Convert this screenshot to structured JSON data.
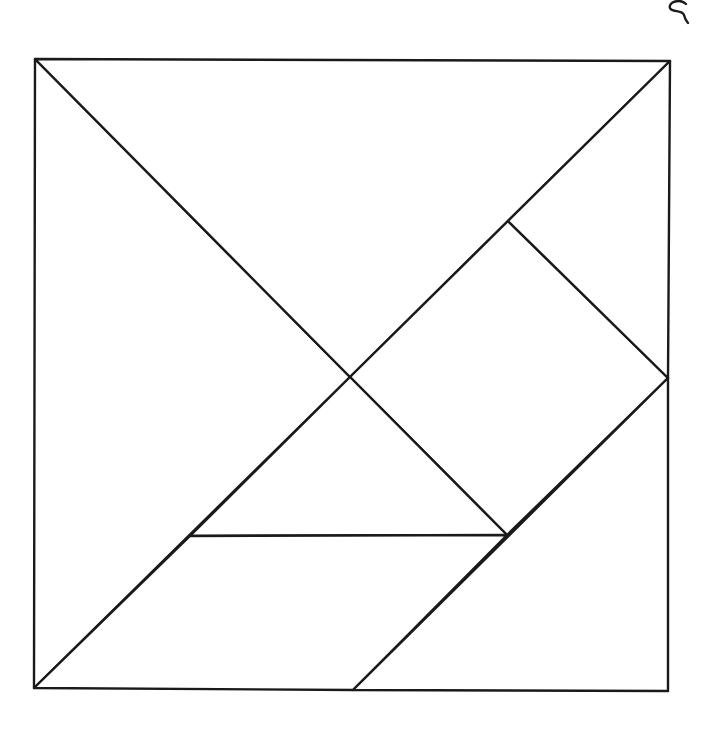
{
  "diagram": {
    "type": "tangram",
    "stroke_color": "#1a1a1a",
    "background": "#ffffff",
    "vertices": {
      "top_left": [
        35,
        59
      ],
      "top_right": [
        670,
        61
      ],
      "bottom_right": [
        668,
        691
      ],
      "bottom_left": [
        34,
        688
      ],
      "center": [
        350,
        377
      ],
      "right_mid": [
        668,
        378
      ],
      "upper_inner": [
        508,
        221
      ],
      "lower_inner": [
        507,
        535
      ],
      "left_inner": [
        190,
        536
      ],
      "bottom_mid": [
        353,
        690
      ]
    },
    "pieces": [
      {
        "name": "large-triangle-left",
        "points": "35,59 350,377 34,688"
      },
      {
        "name": "large-triangle-top",
        "points": "35,59 670,61 350,377"
      },
      {
        "name": "square",
        "points": "508,221 668,378 507,535 350,377"
      },
      {
        "name": "small-triangle-top-right",
        "points": "670,61 668,378 508,221"
      },
      {
        "name": "small-triangle-center",
        "points": "350,377 507,535 190,536"
      },
      {
        "name": "parallelogram",
        "points": "190,536 507,535 353,690 34,688"
      },
      {
        "name": "medium-triangle-bottom-right",
        "points": "668,378 668,691 353,690"
      }
    ],
    "mark": {
      "name": "squiggle-mark",
      "path": "M 686 4 C 680 -2, 668 2, 670 8 C 672 13, 682 9, 684 15 C 685 19, 686 21, 688 23"
    }
  }
}
